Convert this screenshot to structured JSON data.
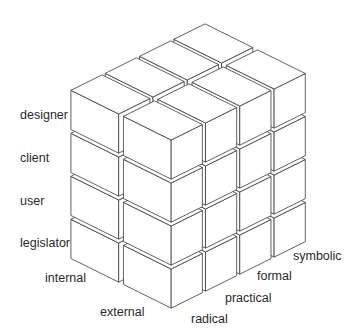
{
  "diagram": {
    "type": "isometric-cube-matrix",
    "vertical_axis": {
      "labels": [
        "designer",
        "client",
        "user",
        "legislator"
      ]
    },
    "depth_axis": {
      "labels": [
        "internal",
        "external"
      ]
    },
    "width_axis": {
      "labels": [
        "radical",
        "practical",
        "formal",
        "symbolic"
      ]
    },
    "colors": {
      "stroke": "#3a3a3a",
      "fill": "#ffffff",
      "text": "#2a2a2a"
    }
  }
}
